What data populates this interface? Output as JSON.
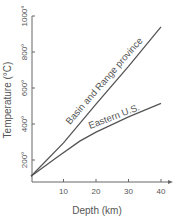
{
  "chart_data": {
    "type": "line",
    "title": "",
    "xlabel": "Depth (km)",
    "ylabel": "Temperature (°C)",
    "xlim": [
      0,
      42
    ],
    "ylim": [
      0,
      1000
    ],
    "xticks": [
      10,
      20,
      30,
      40
    ],
    "xtick_labels": [
      "10",
      "20",
      "30",
      "40"
    ],
    "yticks": [
      200,
      400,
      600,
      800,
      1000
    ],
    "ytick_labels": [
      "200°",
      "400°",
      "600°",
      "800°",
      "1000°"
    ],
    "grid": false,
    "legend": "inline labels along lines",
    "series": [
      {
        "name": "Basin and Range province",
        "x": [
          0,
          10,
          20,
          30,
          40
        ],
        "y": [
          110,
          295,
          510,
          720,
          940
        ]
      },
      {
        "name": "Eastern U.S.",
        "x": [
          0,
          8,
          15,
          20,
          30,
          40
        ],
        "y": [
          110,
          215,
          305,
          355,
          440,
          515
        ]
      }
    ]
  }
}
